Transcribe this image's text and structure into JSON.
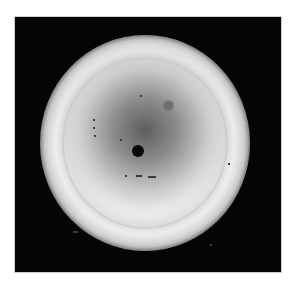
{
  "image": {
    "description": "Grayscale photograph of a circular disc with a dark central shading on a black square background",
    "background_color": "#050505",
    "page_color": "#ffffff",
    "features": {
      "central_dark_spot": {
        "label": "dark spot"
      },
      "secondary_spot": {
        "label": "grey spot"
      }
    }
  }
}
